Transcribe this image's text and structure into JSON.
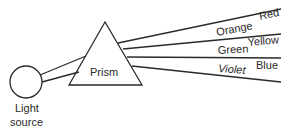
{
  "diagram": {
    "prism_label": "Prism",
    "source_label_line1": "Light",
    "source_label_line2": "source",
    "colors": {
      "red": "Red",
      "orange": "Orange",
      "yellow": "Yellow",
      "green": "Green",
      "blue": "Blue",
      "violet": "Violet"
    },
    "stroke_color": "#2a2a2a",
    "background": "#ffffff"
  }
}
